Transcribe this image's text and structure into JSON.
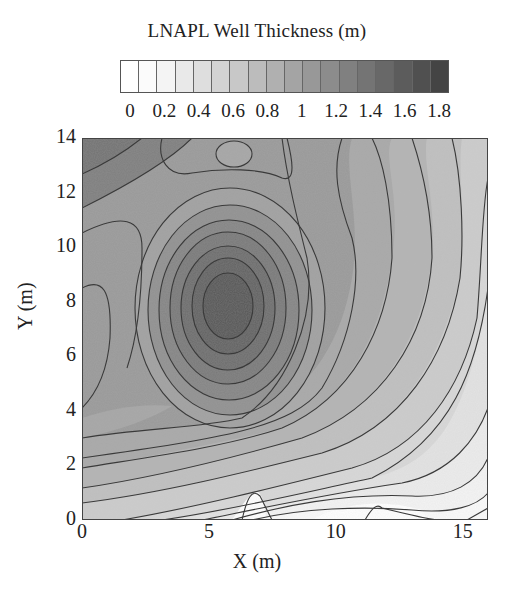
{
  "chart_data": {
    "type": "heatmap",
    "subtype": "filled-contour",
    "title": "LNAPL Well Thickness (m)",
    "xlabel": "X (m)",
    "ylabel": "Y (m)",
    "xlim": [
      0,
      16
    ],
    "ylim": [
      0,
      14
    ],
    "xticks": [
      "0",
      "5",
      "10",
      "15"
    ],
    "yticks": [
      "0",
      "2",
      "4",
      "6",
      "8",
      "10",
      "12",
      "14"
    ],
    "colorbar": {
      "position": "top",
      "min": 0,
      "max": 1.8,
      "step": 0.1,
      "tick_labels": [
        "0",
        "0.2",
        "0.4",
        "0.6",
        "0.8",
        "1",
        "1.2",
        "1.4",
        "1.6",
        "1.8"
      ],
      "levels": [
        0,
        0.1,
        0.2,
        0.3,
        0.4,
        0.5,
        0.6,
        0.7,
        0.8,
        0.9,
        1.0,
        1.1,
        1.2,
        1.3,
        1.4,
        1.5,
        1.6,
        1.7,
        1.8
      ],
      "colors": [
        "#ffffff",
        "#fbfbfb",
        "#f4f4f4",
        "#e9e9e9",
        "#dedede",
        "#d3d3d3",
        "#c8c8c8",
        "#bcbcbc",
        "#b0b0b0",
        "#a4a4a4",
        "#989898",
        "#8c8c8c",
        "#808080",
        "#747474",
        "#686868",
        "#5c5c5c",
        "#505050",
        "#444444"
      ],
      "colormap": "grayscale (white = 0, dark = 1.8)"
    },
    "grid": false,
    "features": [
      {
        "description": "Peak thickness (~1.7-1.8 m) centered near X=5.5, Y=8",
        "x": 5.5,
        "y": 8,
        "value": 1.75
      },
      {
        "description": "Moderate thickness (~1.1-1.3 m) along left side and top-left corner",
        "x": 0.5,
        "y": 13.5,
        "value": 1.3
      },
      {
        "description": "Minimum thickness (~0-0.1 m) near bottom center-right",
        "x": 10,
        "y": 0.5,
        "value": 0.05
      },
      {
        "description": "Low thickness (~0.1-0.3 m) along bottom-right region",
        "x": 15,
        "y": 2,
        "value": 0.15
      },
      {
        "description": "Local closed contour near top at X~6.5, Y~13.5",
        "x": 6.5,
        "y": 13.5,
        "value": 1.0
      }
    ],
    "approx_grid": {
      "x": [
        0,
        2,
        4,
        6,
        8,
        10,
        12,
        14,
        16
      ],
      "y": [
        14,
        12,
        10,
        8,
        6,
        4,
        2,
        0
      ],
      "z": [
        [
          1.3,
          1.2,
          1.1,
          1.0,
          1.0,
          0.9,
          0.8,
          0.7,
          0.6
        ],
        [
          1.2,
          1.1,
          1.2,
          1.2,
          1.0,
          0.9,
          0.8,
          0.6,
          0.5
        ],
        [
          1.0,
          1.0,
          1.4,
          1.5,
          1.2,
          0.9,
          0.7,
          0.5,
          0.4
        ],
        [
          1.0,
          1.0,
          1.6,
          1.8,
          1.3,
          0.9,
          0.6,
          0.4,
          0.3
        ],
        [
          1.0,
          1.0,
          1.4,
          1.5,
          1.1,
          0.8,
          0.5,
          0.35,
          0.3
        ],
        [
          0.9,
          0.9,
          1.0,
          1.0,
          0.8,
          0.6,
          0.4,
          0.25,
          0.2
        ],
        [
          0.8,
          0.6,
          0.4,
          0.3,
          0.3,
          0.2,
          0.15,
          0.1,
          0.1
        ],
        [
          0.9,
          0.5,
          0.2,
          0.05,
          0.05,
          0.05,
          0.1,
          0.1,
          0.05
        ]
      ]
    }
  }
}
